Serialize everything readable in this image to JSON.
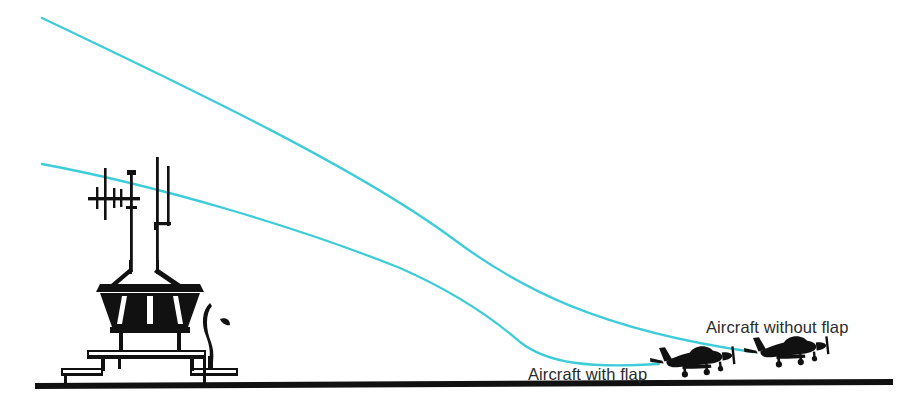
{
  "figure": {
    "type": "technical-line-illustration",
    "background_color": "#ffffff"
  },
  "colors": {
    "glide_path": "#3ECCD8",
    "ink": "#111111",
    "label_text": "#2b2b2b",
    "ground": "#111111"
  },
  "labels": {
    "without_flap": "Aircraft without flap",
    "with_flap": "Aircraft with flap"
  },
  "glide_paths": [
    {
      "name": "without-flap-path",
      "label": "Aircraft without flap",
      "color": "#3ECCD8",
      "description": "Shallower approach path starting high-left, descending to the right aircraft",
      "start": [
        42,
        18
      ],
      "end": [
        752,
        352
      ]
    },
    {
      "name": "with-flap-path",
      "label": "Aircraft with flap",
      "color": "#3ECCD8",
      "description": "Steeper approach path starting lower-left, descending to the left aircraft",
      "start": [
        42,
        164
      ],
      "end": [
        658,
        364
      ]
    }
  ],
  "objects": [
    {
      "name": "control-tower",
      "description": "Air traffic control tower with cab, antennas and stepped base"
    },
    {
      "name": "tower-antenna-mast",
      "description": "Tall vertical antenna masts above tower cab"
    },
    {
      "name": "tower-cab",
      "description": "Dark inverted-trapezoid glazed control cab"
    },
    {
      "name": "tower-base",
      "description": "Stepped building base of the tower"
    },
    {
      "name": "tree",
      "description": "Small tree beside the tower base"
    },
    {
      "name": "ground-line",
      "description": "Horizontal ground / runway surface line"
    },
    {
      "name": "aircraft-with-flap",
      "description": "Light single-engine aircraft silhouette, nearer, lower"
    },
    {
      "name": "aircraft-without-flap",
      "description": "Light single-engine aircraft silhouette, farther right, higher"
    }
  ],
  "ground": {
    "y": 385,
    "x_start": 35,
    "x_end": 893
  }
}
